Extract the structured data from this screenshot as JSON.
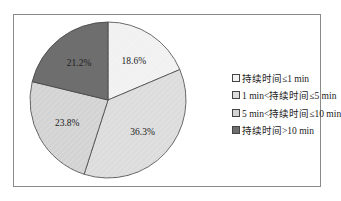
{
  "chart_data": {
    "type": "pie",
    "title": "",
    "categories": [
      "持续时间≤1 min",
      "1 min<持续时间≤5 min",
      "5 min<持续时间≤10 min",
      "持续时间>10 min"
    ],
    "values": [
      18.6,
      36.3,
      23.8,
      21.2
    ],
    "value_labels": [
      "18.6%",
      "36.3%",
      "23.8%",
      "21.2%"
    ],
    "colors": [
      "#f1f1f1",
      "#dcdcdc",
      "#d3d3d3",
      "#6e6e6e"
    ],
    "start_angle": "12 o'clock, clockwise",
    "legend_position": "right"
  },
  "legend": {
    "items": [
      {
        "label": "持续时间≤1 min",
        "color": "#f1f1f1"
      },
      {
        "label": "1 min<持续时间≤5 min",
        "color": "#dcdcdc"
      },
      {
        "label": "5 min<持续时间≤10 min",
        "color": "#d3d3d3"
      },
      {
        "label": "持续时间>10 min",
        "color": "#6e6e6e"
      }
    ]
  }
}
